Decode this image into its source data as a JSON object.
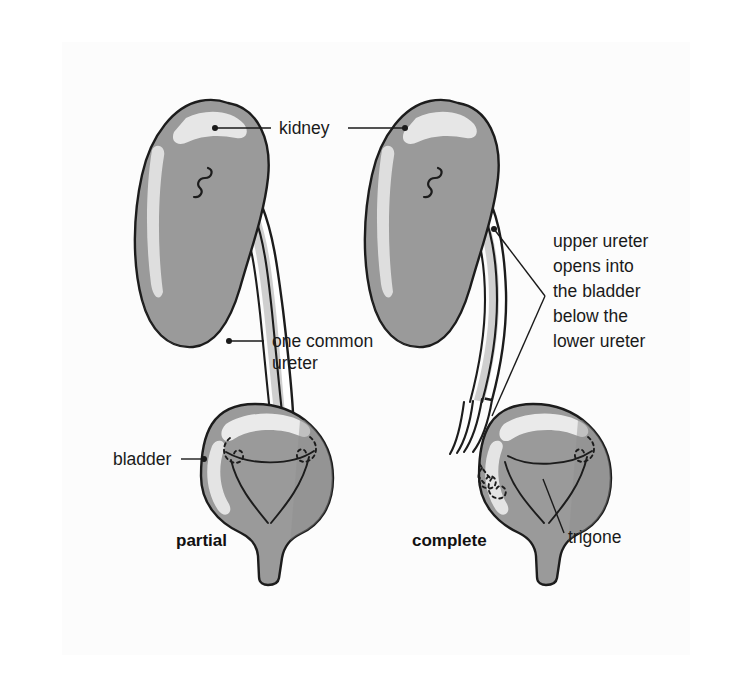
{
  "figure": {
    "background_color": "#ffffff",
    "scan_color": "#fcfcfc",
    "organ_fill": "#9a9a9a",
    "organ_shade": "#8a8a8a",
    "organ_highlight": "#e2e2e2",
    "duct_fill": "#ffffff",
    "duct_shade": "#c8c8c8",
    "outline_color": "#1c1c1c",
    "text_color": "#1a1a1a"
  },
  "labels": {
    "kidney": "kidney",
    "one_common_ureter_line1": "one common",
    "one_common_ureter_line2": "ureter",
    "upper_ureter_line1": "upper ureter",
    "upper_ureter_line2": "opens into",
    "upper_ureter_line3": "the bladder",
    "upper_ureter_line4": "below the",
    "upper_ureter_line5": "lower ureter",
    "bladder": "bladder",
    "trigone": "trigone"
  },
  "panels": [
    {
      "id": "partial",
      "caption": "partial",
      "side": "left",
      "description": "Partial (incomplete) ureteral duplication: two renal pelves unite into one common ureter that enters the bladder through a single orifice.",
      "ureter_count_at_bladder": 1,
      "orifice_count": 2
    },
    {
      "id": "complete",
      "caption": "complete",
      "side": "right",
      "description": "Complete ureteral duplication: two separate ureters run the full length and enter the bladder through two separate orifices.",
      "ureter_count_at_bladder": 2,
      "orifice_count": 2
    }
  ],
  "annotations": [
    {
      "name": "kidney",
      "text": "kidney",
      "points_to": [
        "left-kidney",
        "right-kidney"
      ]
    },
    {
      "name": "one-common-ureter",
      "text": "one common ureter",
      "points_to": [
        "left-ureter"
      ]
    },
    {
      "name": "upper-ureter-note",
      "text": "upper ureter opens into the bladder below the lower ureter",
      "points_to": [
        "right-upper-ureter",
        "right-bladder-orifices"
      ]
    },
    {
      "name": "bladder",
      "text": "bladder",
      "points_to": [
        "left-bladder"
      ]
    },
    {
      "name": "trigone",
      "text": "trigone",
      "points_to": [
        "right-bladder-trigone"
      ]
    }
  ]
}
